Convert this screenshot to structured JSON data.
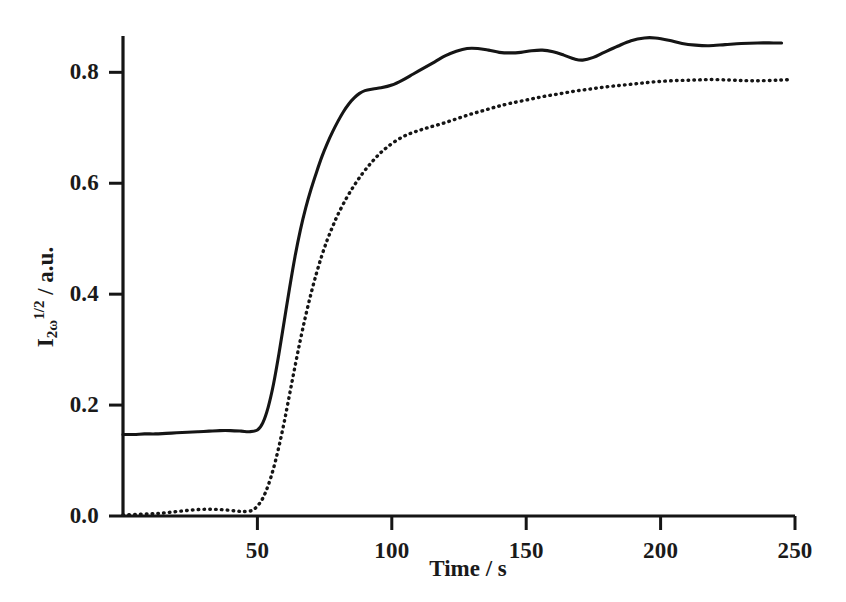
{
  "figure": {
    "background_color": "#ffffff",
    "ink_color": "#151515"
  },
  "axes": {
    "x_title": "Time / s",
    "y_title_base": "I",
    "y_title_sub": "2ω",
    "y_title_sup": "1/2",
    "y_title_unit": "/ a.u.",
    "x_tick_labels": [
      "50",
      "100",
      "150",
      "200",
      "250"
    ],
    "y_tick_labels": [
      "0.0",
      "0.2",
      "0.4",
      "0.6",
      "0.8"
    ]
  },
  "chart_data": {
    "type": "line",
    "title": "",
    "xlabel": "Time / s",
    "ylabel": "I_2ω^(1/2) / a.u.",
    "xlim": [
      0,
      250
    ],
    "ylim": [
      0.0,
      0.9
    ],
    "xticks": [
      50,
      100,
      150,
      200,
      250
    ],
    "yticks": [
      0.0,
      0.2,
      0.4,
      0.6,
      0.8
    ],
    "grid": false,
    "legend": "none",
    "series": [
      {
        "name": "solid-curve",
        "style": "solid",
        "color": "#151515",
        "points": [
          [
            0,
            0.147
          ],
          [
            4,
            0.147
          ],
          [
            8,
            0.148
          ],
          [
            12,
            0.148
          ],
          [
            16,
            0.149
          ],
          [
            20,
            0.15
          ],
          [
            24,
            0.151
          ],
          [
            28,
            0.152
          ],
          [
            32,
            0.153
          ],
          [
            36,
            0.154
          ],
          [
            40,
            0.154
          ],
          [
            44,
            0.153
          ],
          [
            47,
            0.152
          ],
          [
            50,
            0.155
          ],
          [
            52,
            0.168
          ],
          [
            54,
            0.196
          ],
          [
            56,
            0.238
          ],
          [
            58,
            0.292
          ],
          [
            60,
            0.352
          ],
          [
            62,
            0.412
          ],
          [
            64,
            0.468
          ],
          [
            66,
            0.516
          ],
          [
            68,
            0.556
          ],
          [
            70,
            0.59
          ],
          [
            72,
            0.62
          ],
          [
            74,
            0.648
          ],
          [
            76,
            0.672
          ],
          [
            78,
            0.693
          ],
          [
            80,
            0.712
          ],
          [
            82,
            0.729
          ],
          [
            84,
            0.743
          ],
          [
            86,
            0.754
          ],
          [
            88,
            0.762
          ],
          [
            90,
            0.767
          ],
          [
            93,
            0.77
          ],
          [
            96,
            0.772
          ],
          [
            100,
            0.777
          ],
          [
            104,
            0.786
          ],
          [
            108,
            0.797
          ],
          [
            112,
            0.808
          ],
          [
            116,
            0.819
          ],
          [
            120,
            0.83
          ],
          [
            124,
            0.838
          ],
          [
            128,
            0.843
          ],
          [
            132,
            0.843
          ],
          [
            136,
            0.84
          ],
          [
            140,
            0.836
          ],
          [
            144,
            0.835
          ],
          [
            148,
            0.836
          ],
          [
            152,
            0.839
          ],
          [
            156,
            0.84
          ],
          [
            160,
            0.837
          ],
          [
            164,
            0.831
          ],
          [
            168,
            0.824
          ],
          [
            171,
            0.822
          ],
          [
            175,
            0.827
          ],
          [
            179,
            0.836
          ],
          [
            184,
            0.847
          ],
          [
            189,
            0.857
          ],
          [
            194,
            0.862
          ],
          [
            198,
            0.862
          ],
          [
            203,
            0.858
          ],
          [
            208,
            0.852
          ],
          [
            213,
            0.849
          ],
          [
            218,
            0.848
          ],
          [
            224,
            0.85
          ],
          [
            230,
            0.852
          ],
          [
            236,
            0.853
          ],
          [
            242,
            0.853
          ],
          [
            245,
            0.853
          ]
        ]
      },
      {
        "name": "dotted-curve",
        "style": "dotted",
        "color": "#151515",
        "points": [
          [
            0,
            0.002
          ],
          [
            5,
            0.003
          ],
          [
            10,
            0.004
          ],
          [
            14,
            0.005
          ],
          [
            18,
            0.007
          ],
          [
            22,
            0.009
          ],
          [
            26,
            0.011
          ],
          [
            30,
            0.012
          ],
          [
            34,
            0.012
          ],
          [
            38,
            0.011
          ],
          [
            42,
            0.009
          ],
          [
            45,
            0.008
          ],
          [
            48,
            0.01
          ],
          [
            50,
            0.018
          ],
          [
            52,
            0.032
          ],
          [
            54,
            0.055
          ],
          [
            56,
            0.086
          ],
          [
            58,
            0.125
          ],
          [
            60,
            0.17
          ],
          [
            62,
            0.22
          ],
          [
            64,
            0.27
          ],
          [
            66,
            0.318
          ],
          [
            68,
            0.362
          ],
          [
            70,
            0.402
          ],
          [
            72,
            0.438
          ],
          [
            74,
            0.47
          ],
          [
            76,
            0.498
          ],
          [
            78,
            0.522
          ],
          [
            80,
            0.544
          ],
          [
            83,
            0.572
          ],
          [
            86,
            0.596
          ],
          [
            89,
            0.617
          ],
          [
            92,
            0.635
          ],
          [
            95,
            0.651
          ],
          [
            98,
            0.664
          ],
          [
            102,
            0.678
          ],
          [
            106,
            0.688
          ],
          [
            110,
            0.695
          ],
          [
            114,
            0.701
          ],
          [
            119,
            0.708
          ],
          [
            124,
            0.716
          ],
          [
            129,
            0.724
          ],
          [
            134,
            0.731
          ],
          [
            139,
            0.738
          ],
          [
            144,
            0.744
          ],
          [
            150,
            0.75
          ],
          [
            156,
            0.756
          ],
          [
            162,
            0.761
          ],
          [
            168,
            0.766
          ],
          [
            174,
            0.77
          ],
          [
            180,
            0.774
          ],
          [
            186,
            0.777
          ],
          [
            192,
            0.78
          ],
          [
            198,
            0.783
          ],
          [
            205,
            0.785
          ],
          [
            212,
            0.786
          ],
          [
            219,
            0.787
          ],
          [
            226,
            0.786
          ],
          [
            232,
            0.785
          ],
          [
            238,
            0.785
          ],
          [
            244,
            0.786
          ],
          [
            249,
            0.787
          ]
        ]
      }
    ]
  }
}
